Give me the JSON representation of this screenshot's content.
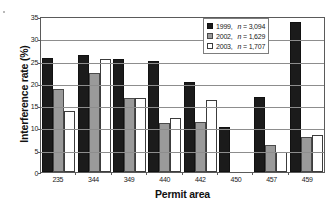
{
  "chart_data": {
    "type": "bar",
    "title": "",
    "xlabel": "Permit area",
    "ylabel": "Interference rate (%)",
    "categories": [
      "235",
      "344",
      "349",
      "440",
      "442",
      "450",
      "457",
      "459"
    ],
    "series": [
      {
        "name": "1999",
        "n": "3,094",
        "legend_label": "1999,",
        "legend_n": "n = 3,094",
        "color": "#1b1b1b",
        "values": [
          25.6,
          26.2,
          25.3,
          24.9,
          20.1,
          10.1,
          16.9,
          33.6
        ]
      },
      {
        "name": "2002",
        "n": "1,629",
        "legend_label": "2002,",
        "legend_n": "n = 1,629",
        "color": "#9a9a9a",
        "values": [
          18.7,
          22.2,
          16.5,
          11.0,
          11.3,
          null,
          6.1,
          7.9
        ]
      },
      {
        "name": "2003",
        "n": "1,707",
        "legend_label": "2003,",
        "legend_n": "n = 1,707",
        "color": "#ffffff",
        "values": [
          13.7,
          25.4,
          16.5,
          12.1,
          16.1,
          null,
          4.5,
          8.3
        ]
      }
    ],
    "ylim": [
      0,
      35
    ],
    "yticks": [
      0,
      5,
      10,
      15,
      20,
      25,
      30,
      35
    ],
    "ytick_labels": [
      "0",
      "5",
      "10",
      "15",
      "20",
      "25",
      "30",
      "35"
    ],
    "grid": true,
    "legend_position": "top-right"
  }
}
